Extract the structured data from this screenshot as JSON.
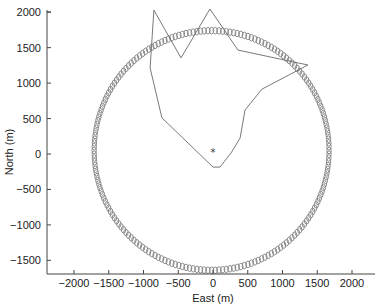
{
  "chart_data": {
    "type": "scatter",
    "title": "",
    "xlabel": "East (m)",
    "ylabel": "North (m)",
    "xlim": [
      -2300,
      2350
    ],
    "ylim": [
      -1700,
      2000
    ],
    "xticks": [
      -2000,
      -1500,
      -1000,
      -500,
      0,
      500,
      1000,
      1500,
      2000
    ],
    "xtick_labels": [
      "−2000",
      "−1500",
      "−1000",
      "−500",
      "0",
      "500",
      "1000",
      "1500",
      "2000"
    ],
    "yticks": [
      2000,
      1500,
      1000,
      500,
      0,
      -500,
      -1000,
      -1500
    ],
    "ytick_labels": [
      "2000",
      "1500",
      "1000",
      "500",
      "0",
      "−500",
      "−1000",
      "−1500"
    ],
    "grid": false,
    "legend": null,
    "series": [
      {
        "name": "circle-markers",
        "type": "scatter",
        "marker": "o",
        "color": "#8a8a8a",
        "center": [
          -20,
          50
        ],
        "radius": 1690,
        "count": 200
      },
      {
        "name": "trajectory",
        "type": "line",
        "closed": true,
        "color": "#6a6a6a",
        "x": [
          -850,
          -460,
          -45,
          360,
          1365,
          705,
          460,
          390,
          260,
          100,
          0,
          -735,
          -905,
          -850
        ],
        "y": [
          2030,
          1355,
          2045,
          1465,
          1255,
          915,
          620,
          225,
          15,
          -185,
          -185,
          510,
          1215,
          2030
        ]
      },
      {
        "name": "origin",
        "type": "scatter",
        "marker": "*",
        "color": "#333333",
        "x": [
          0
        ],
        "y": [
          30
        ]
      }
    ]
  },
  "labels": {
    "xlabel": "East (m)",
    "ylabel": "North (m)",
    "origin_marker": "*"
  }
}
